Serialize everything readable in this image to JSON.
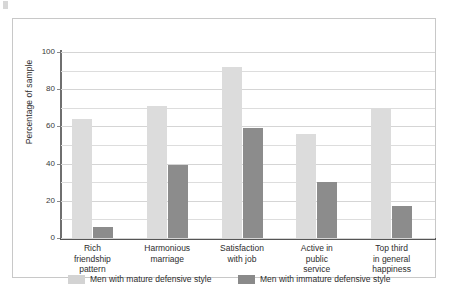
{
  "chart_data": {
    "type": "bar",
    "title": "",
    "xlabel": "",
    "ylabel": "Percentage of sample",
    "ylim": [
      0,
      100
    ],
    "ytick_labels": [
      "0",
      "20",
      "40",
      "60",
      "80",
      "100"
    ],
    "ytick_values": [
      0,
      20,
      40,
      60,
      80,
      100
    ],
    "gridline_interval": 10,
    "grid": true,
    "legend_position": "bottom",
    "categories": [
      "Rich\nfriendship\npattern",
      "Harmonious\nmarriage",
      "Satisfaction\nwith job",
      "Active in\npublic\nservice",
      "Top third\nin general\nhappiness"
    ],
    "series": [
      {
        "name": "Men with mature defensive style",
        "color": "#dcdcdc",
        "values": [
          64,
          71,
          92,
          56,
          70
        ]
      },
      {
        "name": "Men with immature defensive style",
        "color": "#8c8c8c",
        "values": [
          6,
          39,
          59,
          30,
          17
        ]
      }
    ]
  },
  "legend": {
    "entries": [
      {
        "label": "Men with mature defensive style",
        "swatch": "mature"
      },
      {
        "label": "Men with immature defensive style",
        "swatch": "immature"
      }
    ]
  },
  "colors": {
    "mature_bar": "#dcdcdc",
    "immature_bar": "#8c8c8c",
    "gridline": "#dddddd",
    "axis": "#555555",
    "frame_border": "#c8c8c8",
    "text": "#2d2d2d",
    "background": "#ffffff"
  }
}
